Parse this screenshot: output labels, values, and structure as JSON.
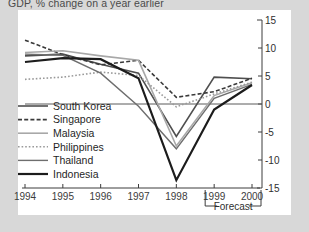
{
  "chart_data": {
    "type": "line",
    "title": "GDP, % change on a year earlier",
    "xlabel": "",
    "ylabel": "",
    "x": [
      1994,
      1995,
      1996,
      1997,
      1998,
      1999,
      2000
    ],
    "xticklabels": [
      "1994",
      "1995",
      "1996",
      "1997",
      "1998",
      "1999",
      "2000"
    ],
    "yticks": [
      -15,
      -10,
      -5,
      0,
      5,
      10,
      15
    ],
    "yticklabels": [
      "-15",
      "-10",
      "-5",
      "0",
      "5",
      "10",
      "15"
    ],
    "ylim": [
      -15,
      15
    ],
    "xlim": [
      1994,
      2000
    ],
    "grid": false,
    "zero_line": true,
    "y_axis_position": "right",
    "legend_position": "inside-lower-left",
    "annotation": "Forecast",
    "annotation_span": [
      "1999",
      "2000"
    ],
    "series": [
      {
        "name": "South Korea",
        "style": "solid",
        "width": 1.6,
        "color": "#4f4f4f",
        "values": [
          8.6,
          8.9,
          7.1,
          5.5,
          -5.8,
          4.8,
          4.5
        ]
      },
      {
        "name": "Singapore",
        "style": "dashed",
        "width": 1.6,
        "color": "#3a3a3a",
        "values": [
          11.4,
          8.8,
          7.0,
          7.8,
          1.2,
          2.2,
          4.6
        ]
      },
      {
        "name": "Malaysia",
        "style": "solid",
        "width": 1.6,
        "color": "#a8a8a8",
        "values": [
          9.2,
          9.5,
          8.6,
          7.8,
          -7.5,
          1.5,
          3.8
        ]
      },
      {
        "name": "Philippines",
        "style": "dotted",
        "width": 1.6,
        "color": "#9a9a9a",
        "values": [
          4.4,
          4.8,
          5.7,
          5.1,
          -0.5,
          1.8,
          3.9
        ]
      },
      {
        "name": "Thailand",
        "style": "solid",
        "width": 1.4,
        "color": "#6e6e6e",
        "values": [
          8.9,
          8.7,
          5.5,
          -0.4,
          -8.0,
          1.0,
          3.5
        ]
      },
      {
        "name": "Indonesia",
        "style": "solid",
        "width": 2.2,
        "color": "#1c1c1c",
        "values": [
          7.5,
          8.2,
          8.0,
          4.6,
          -13.6,
          -1.0,
          3.4
        ]
      }
    ]
  }
}
